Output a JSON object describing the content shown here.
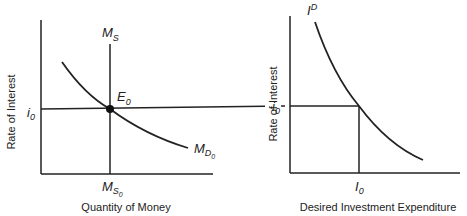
{
  "figure": {
    "left_panel": {
      "title": "Money market",
      "y_axis_label": "Rate of Interest",
      "x_axis_label": "Quantity of Money",
      "supply_label": {
        "base": "M",
        "sub": "S"
      },
      "supply_tick_label": {
        "base": "M",
        "sub": "S",
        "subsub": "0"
      },
      "demand_label": {
        "base": "M",
        "sub": "D",
        "subsub": "0"
      },
      "equilibrium_label": {
        "base": "E",
        "sub": "0"
      },
      "interest_tick_label": {
        "base": "i",
        "sub": "0"
      }
    },
    "right_panel": {
      "title": "Investment demand",
      "y_axis_label": "Rate of Interest",
      "x_axis_label": "Desired Investment Expenditure",
      "curve_label": {
        "base": "I",
        "sup": "D"
      },
      "interest_tick_label": {
        "base": "i",
        "sub": "0"
      },
      "investment_tick_label": {
        "base": "I",
        "sub": "0"
      }
    }
  },
  "colors": {
    "line": "#222222",
    "background": "#ffffff"
  }
}
